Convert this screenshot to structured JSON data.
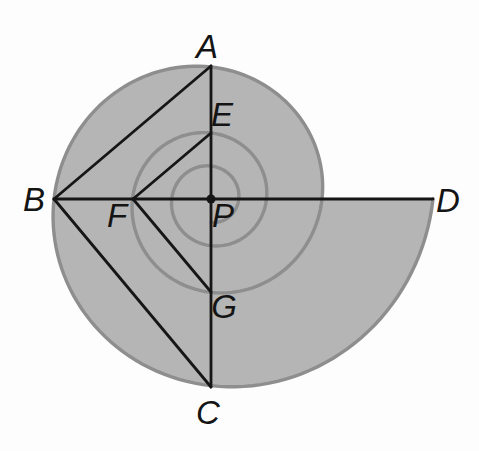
{
  "diagram": {
    "colors": {
      "background": "#fdfdfd",
      "region_fill": "#b5b5b5",
      "arc_stroke": "#8e8e8e",
      "line_stroke": "#161616",
      "label_color": "#141414"
    },
    "center": {
      "x": 211,
      "y": 199
    },
    "spiral": {
      "outer_radius": 222,
      "decay_per_turn": 0.5,
      "start_angle_deg": 0,
      "end_angle_deg": 1170,
      "fill_turn_end_deg": 360
    },
    "points": {
      "A": {
        "x": 211,
        "y": 66
      },
      "B": {
        "x": 54,
        "y": 199
      },
      "C": {
        "x": 211,
        "y": 387
      },
      "D": {
        "x": 433,
        "y": 199
      },
      "E": {
        "x": 211,
        "y": 133
      },
      "F": {
        "x": 133,
        "y": 199
      },
      "G": {
        "x": 211,
        "y": 292
      },
      "P": {
        "x": 211,
        "y": 199
      }
    },
    "segments": [
      {
        "from": "B",
        "to": "D"
      },
      {
        "from": "A",
        "to": "C"
      },
      {
        "from": "B",
        "to": "A"
      },
      {
        "from": "B",
        "to": "C"
      },
      {
        "from": "F",
        "to": "E"
      },
      {
        "from": "F",
        "to": "G"
      }
    ],
    "labels": [
      {
        "text": "A",
        "x": 207,
        "y": 58
      },
      {
        "text": "B",
        "x": 34,
        "y": 211
      },
      {
        "text": "C",
        "x": 208,
        "y": 424
      },
      {
        "text": "D",
        "x": 448,
        "y": 212
      },
      {
        "text": "E",
        "x": 222,
        "y": 126
      },
      {
        "text": "F",
        "x": 117,
        "y": 227
      },
      {
        "text": "G",
        "x": 224,
        "y": 318
      },
      {
        "text": "P",
        "x": 223,
        "y": 227
      }
    ]
  }
}
